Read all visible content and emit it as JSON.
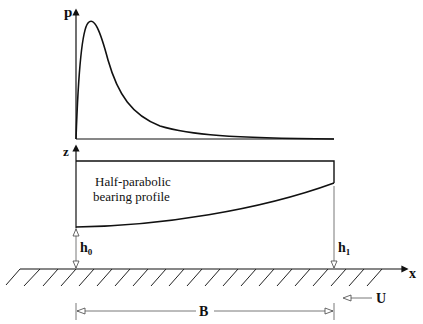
{
  "diagram": {
    "pressure_axis_label": "p",
    "height_axis_label": "z",
    "profile_label_line1": "Half-parabolic",
    "profile_label_line2": "bearing profile",
    "inlet_gap_label": "h",
    "inlet_gap_subscript": "0",
    "outlet_gap_label": "h",
    "outlet_gap_subscript": "1",
    "x_axis_label": "x",
    "velocity_label": "U",
    "width_label": "B"
  },
  "colors": {
    "line": "#111111",
    "thin_line": "#555555"
  }
}
